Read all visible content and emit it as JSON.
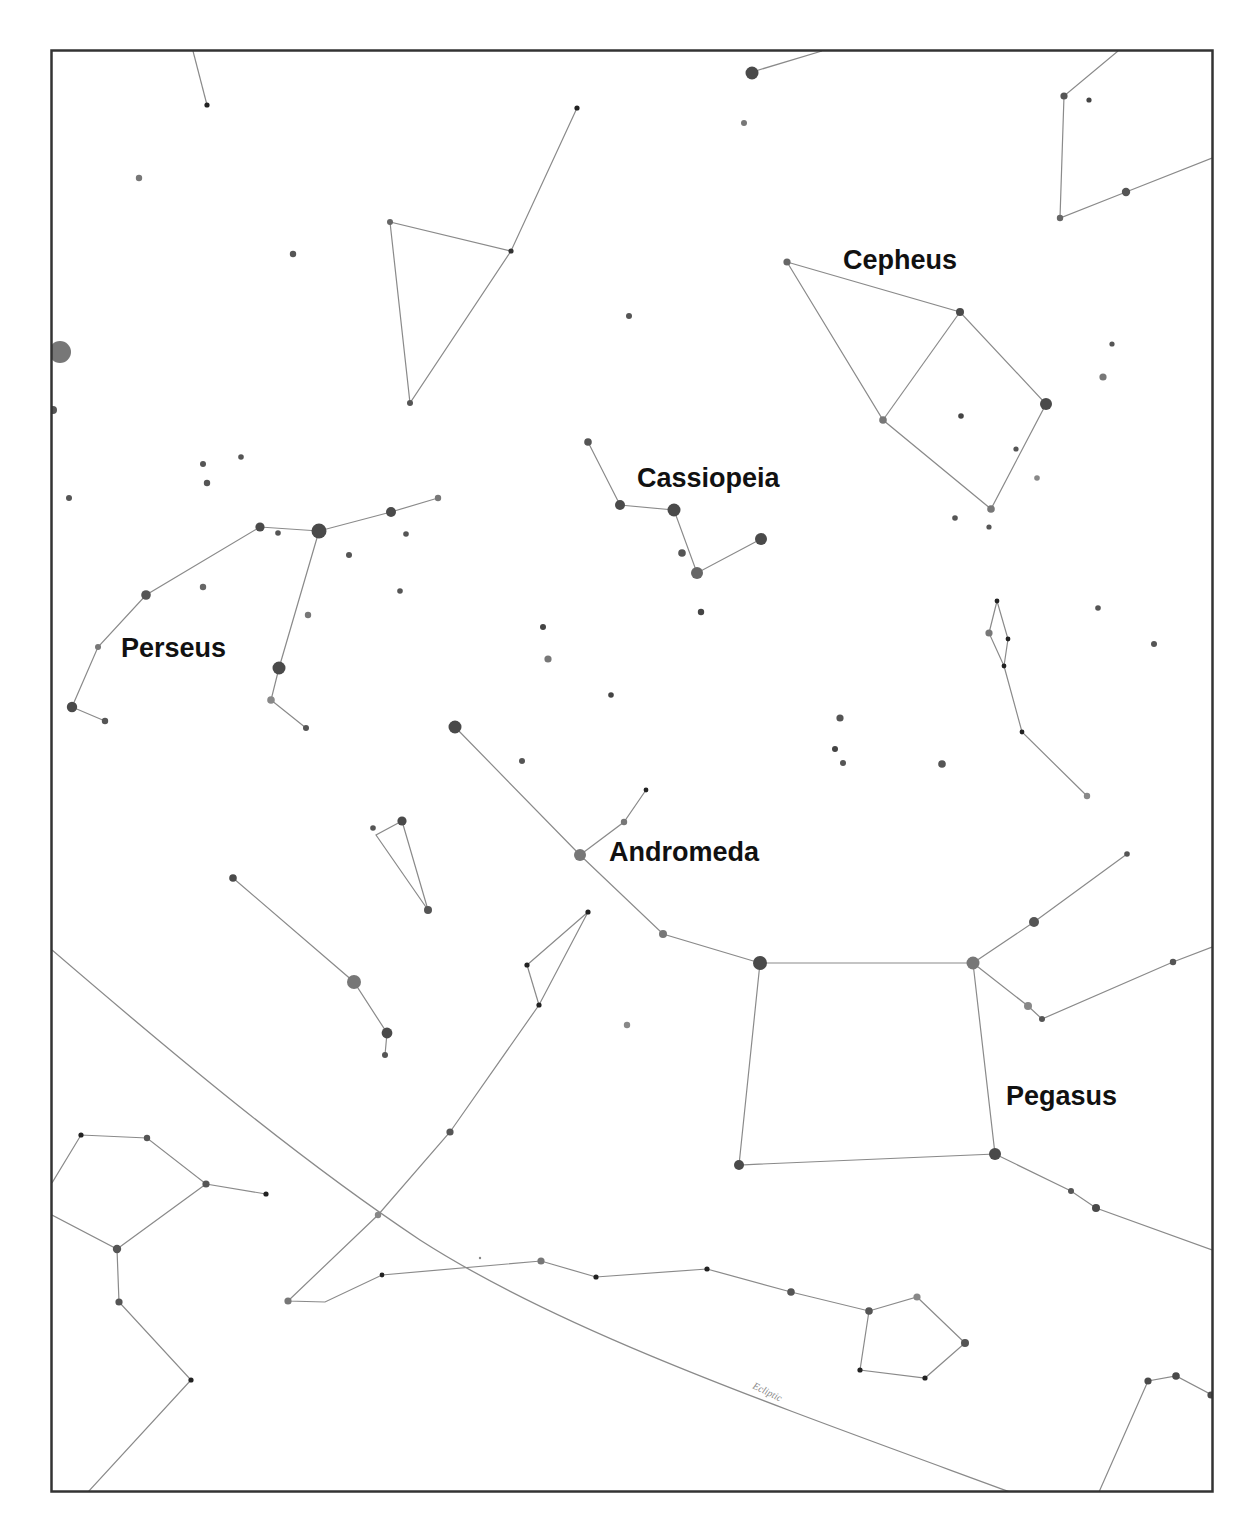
{
  "chart_title": "Star chart: Perseus, Cassiopeia, Cepheus, Andromeda and Pegasus region",
  "colors": {
    "frame": "#333333",
    "lines": "#8a8a8a",
    "star_bright": "#555555",
    "star_dim": "#777777",
    "star_faint": "#222222",
    "label": "#111111",
    "background": "#ffffff"
  },
  "labels": {
    "cepheus": "Cepheus",
    "cassiopeia": "Cassiopeia",
    "perseus": "Perseus",
    "andromeda": "Andromeda",
    "pegasus": "Pegasus",
    "ecliptic": "Ecliptic"
  },
  "label_positions": {
    "cepheus": [
      843,
      269
    ],
    "cassiopeia": [
      637,
      487
    ],
    "perseus": [
      121,
      657
    ],
    "andromeda": [
      609,
      861
    ],
    "pegasus": [
      1006,
      1105
    ]
  },
  "frame": {
    "x": 51,
    "y": 50,
    "width": 1162,
    "height": 1442
  }
}
